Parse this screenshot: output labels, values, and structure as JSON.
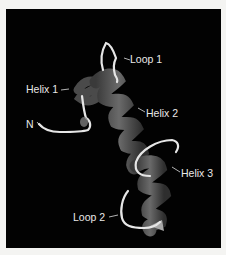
{
  "figure": {
    "type": "protein-ribbon-structure",
    "background_color": "#020202",
    "border_color": "#f4f4f2",
    "helix_color": "#5a5a5a",
    "loop_color": "#e6e6e6",
    "labels": {
      "loop1": "Loop 1",
      "helix1": "Helix 1",
      "helix2": "Helix 2",
      "n_terminus": "N",
      "helix3": "Helix 3",
      "loop2": "Loop 2"
    }
  }
}
